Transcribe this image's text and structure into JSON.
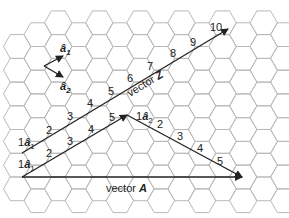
{
  "diagram": {
    "type": "hexagonal-lattice-vector-diagram",
    "colors": {
      "grid": "#b9b9b9",
      "vector": "#222222",
      "background": "#ffffff"
    },
    "unit_vectors": {
      "a1_label": "â",
      "a1_sub": "1",
      "a2_label": "â",
      "a2_sub": "2"
    },
    "vector_Z": {
      "label_prefix": "vector ",
      "label_name": "Z",
      "ticks": [
        "1â1",
        "2",
        "3",
        "4",
        "5",
        "6",
        "7",
        "8",
        "9",
        "10"
      ]
    },
    "path_a1": {
      "ticks": [
        "1â1",
        "2",
        "3",
        "4",
        "5"
      ]
    },
    "path_a2": {
      "ticks": [
        "1â2",
        "2",
        "3",
        "4",
        "5"
      ]
    },
    "vector_A": {
      "label_prefix": "vector ",
      "label_name": "A"
    },
    "tick_text": {
      "one": "1",
      "two": "2",
      "three": "3",
      "four": "4",
      "five": "5",
      "six": "6",
      "seven": "7",
      "eight": "8",
      "nine": "9",
      "ten": "10"
    }
  }
}
